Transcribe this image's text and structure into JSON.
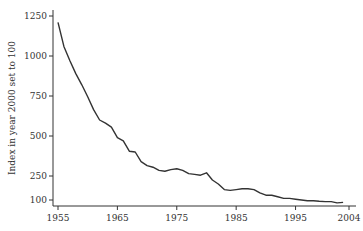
{
  "chart_data": {
    "type": "line",
    "title": "",
    "xlabel": "",
    "ylabel": "Index in year 2000 set to 100",
    "xlim": [
      1955,
      2004
    ],
    "ylim": [
      100,
      1250
    ],
    "grid": false,
    "legend": null,
    "x_ticks": [
      1955,
      1965,
      1975,
      1985,
      1995,
      2004
    ],
    "x_tick_labels": [
      "1955",
      "1965",
      "1975",
      "1985",
      "1995",
      "2004"
    ],
    "y_ticks": [
      100,
      250,
      500,
      750,
      1000,
      1250
    ],
    "y_tick_labels": [
      "100",
      "250",
      "500",
      "750",
      "1000",
      "1250"
    ],
    "series": [
      {
        "name": "Index",
        "color": "#333333",
        "x": [
          1955,
          1956,
          1957,
          1958,
          1959,
          1960,
          1961,
          1962,
          1963,
          1964,
          1965,
          1966,
          1967,
          1968,
          1969,
          1970,
          1971,
          1972,
          1973,
          1974,
          1975,
          1976,
          1977,
          1978,
          1979,
          1980,
          1981,
          1982,
          1983,
          1984,
          1985,
          1986,
          1987,
          1988,
          1989,
          1990,
          1991,
          1992,
          1993,
          1994,
          1995,
          1996,
          1997,
          1998,
          1999,
          2000,
          2001,
          2002,
          2003
        ],
        "values": [
          1210,
          1060,
          970,
          890,
          820,
          745,
          665,
          600,
          580,
          555,
          490,
          470,
          405,
          400,
          340,
          315,
          305,
          285,
          280,
          290,
          295,
          285,
          265,
          260,
          255,
          270,
          225,
          200,
          165,
          160,
          165,
          170,
          170,
          165,
          145,
          130,
          130,
          120,
          110,
          110,
          105,
          100,
          95,
          95,
          92,
          90,
          90,
          82,
          85
        ]
      }
    ]
  }
}
